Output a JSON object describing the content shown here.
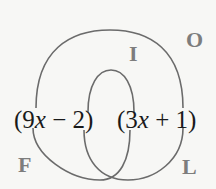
{
  "diagram": {
    "expression": {
      "left_factor": {
        "open": "(9",
        "var": "x",
        "rest": " − 2)"
      },
      "right_factor": {
        "open": "(3",
        "var": "x",
        "rest": " + 1)"
      }
    },
    "labels": {
      "first": "F",
      "outer": "O",
      "inner": "I",
      "last": "L"
    },
    "colors": {
      "arc": "#6b6b6b",
      "label": "#7d7d7d",
      "text": "#1a1a1a"
    }
  }
}
